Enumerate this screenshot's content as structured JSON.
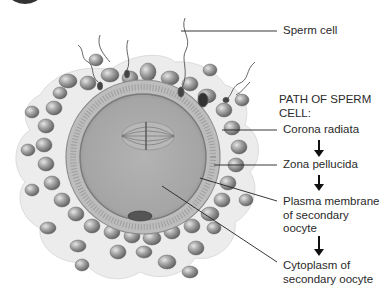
{
  "labels": {
    "sperm_cell": "Sperm cell",
    "path_heading_line1": "PATH OF SPERM",
    "path_heading_line2": "CELL:",
    "corona_radiata": "Corona radiata",
    "zona_pellucida": "Zona pellucida",
    "plasma_membrane_line1": "Plasma membrane",
    "plasma_membrane_line2": "of secondary",
    "plasma_membrane_line3": "oocyte",
    "cytoplasm_line1": "Cytoplasm of",
    "cytoplasm_line2": "secondary oocyte"
  },
  "path_sequence": [
    "Corona radiata",
    "Zona pellucida",
    "Plasma membrane of secondary oocyte",
    "Cytoplasm of secondary oocyte"
  ],
  "colors": {
    "background": "#ffffff",
    "cumulus": "#e9e9e9",
    "cell_body": "#9a9a9a",
    "zona": "#b4b4b4",
    "cytoplasm": "#a8a8a8",
    "leader_line": "#222222",
    "arrow": "#111111"
  }
}
